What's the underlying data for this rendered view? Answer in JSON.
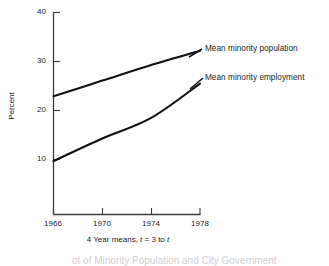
{
  "chart_data": {
    "type": "line",
    "title": "",
    "xlabel": "4 Year means, t = 3 to t",
    "ylabel": "Percent",
    "x": [
      1966,
      1970,
      1974,
      1978
    ],
    "xlim": [
      1966,
      1978
    ],
    "ylim": [
      0,
      40
    ],
    "yticks": [
      10,
      20,
      30,
      40
    ],
    "xticks": [
      1966,
      1970,
      1974,
      1978
    ],
    "grid": false,
    "legend_position": "inline-right-of-line-end",
    "series": [
      {
        "name": "Mean minority population",
        "values": [
          22.9,
          26.1,
          29.3,
          32.2
        ],
        "color": "#111111"
      },
      {
        "name": "Mean minority employment",
        "values": [
          9.7,
          14.3,
          18.5,
          25.5
        ],
        "color": "#111111"
      }
    ]
  },
  "axis": {
    "ylabel": "Percent",
    "xlabel_parts": {
      "pre": "4 Year means, ",
      "t1": "t",
      "mid": " = 3 to ",
      "t2": "t"
    },
    "ytick_labels": [
      "40",
      "30",
      "20",
      "10"
    ],
    "xtick_labels": [
      "1966",
      "1970",
      "1974",
      "1978"
    ]
  },
  "labels": {
    "population": "Mean minority population",
    "employment": "Mean minority employment"
  },
  "caption": {
    "partial_text": "ot of Minority Population and City Government"
  },
  "colors": {
    "line": "#111111",
    "axis": "#444444",
    "text": "#1a1a1a",
    "background": "#ffffff"
  }
}
